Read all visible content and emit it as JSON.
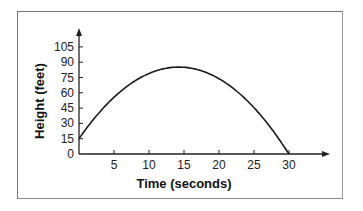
{
  "chart_data": {
    "type": "line",
    "title": "",
    "xlabel": "Time (seconds)",
    "ylabel": "Height (feet)",
    "x_ticks": [
      5,
      10,
      15,
      20,
      25,
      30
    ],
    "y_ticks": [
      0,
      15,
      30,
      45,
      60,
      75,
      90,
      105
    ],
    "xlim": [
      0,
      35
    ],
    "ylim": [
      0,
      115
    ],
    "grid": false,
    "legend": null,
    "series": [
      {
        "name": "height",
        "x": [
          0,
          2.5,
          5,
          7.5,
          10,
          12.5,
          14.5,
          17.5,
          20,
          22.5,
          25,
          27.5,
          30
        ],
        "y": [
          15,
          38,
          56,
          69,
          78,
          84,
          85,
          82,
          75,
          62,
          45,
          24,
          0
        ]
      }
    ]
  }
}
